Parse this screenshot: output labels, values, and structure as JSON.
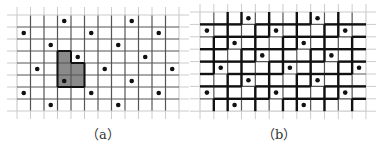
{
  "panels": [
    {
      "id": "a",
      "caption": "（a）",
      "grid": {
        "columns": 12,
        "rows": 8
      },
      "dots": [
        [
          3,
          0
        ],
        [
          8,
          0
        ],
        [
          0,
          1
        ],
        [
          5,
          1
        ],
        [
          10,
          1
        ],
        [
          2,
          2
        ],
        [
          7,
          2
        ],
        [
          4,
          3
        ],
        [
          9,
          3
        ],
        [
          1,
          4
        ],
        [
          6,
          4
        ],
        [
          11,
          4
        ],
        [
          3,
          5
        ],
        [
          8,
          5
        ],
        [
          0,
          6
        ],
        [
          5,
          6
        ],
        [
          10,
          6
        ],
        [
          2,
          7
        ],
        [
          7,
          7
        ]
      ],
      "highlighted_region": {
        "anchor_dot": [
          3,
          5
        ],
        "cells": [
          [
            3,
            3
          ],
          [
            3,
            4
          ],
          [
            3,
            5
          ],
          [
            4,
            4
          ],
          [
            4,
            5
          ]
        ],
        "fill": "#8a8a8a"
      }
    },
    {
      "id": "b",
      "caption": "（b）",
      "grid": {
        "columns": 12,
        "rows": 8
      },
      "dots": [
        [
          3,
          0
        ],
        [
          8,
          0
        ],
        [
          0,
          1
        ],
        [
          5,
          1
        ],
        [
          10,
          1
        ],
        [
          2,
          2
        ],
        [
          7,
          2
        ],
        [
          4,
          3
        ],
        [
          9,
          3
        ],
        [
          1,
          4
        ],
        [
          6,
          4
        ],
        [
          11,
          4
        ],
        [
          3,
          5
        ],
        [
          8,
          5
        ],
        [
          0,
          6
        ],
        [
          5,
          6
        ],
        [
          10,
          6
        ],
        [
          2,
          7
        ],
        [
          7,
          7
        ]
      ],
      "tile_shape_offsets": [
        [
          0,
          0
        ],
        [
          1,
          0
        ],
        [
          0,
          1
        ],
        [
          -1,
          1
        ],
        [
          2,
          -1
        ]
      ],
      "lattice_vectors": [
        [
          5,
          0
        ],
        [
          2,
          1
        ]
      ]
    }
  ],
  "colors": {
    "grid": "#555555",
    "faint": "#cccccc",
    "thick": "#111111",
    "dot": "#111111"
  }
}
